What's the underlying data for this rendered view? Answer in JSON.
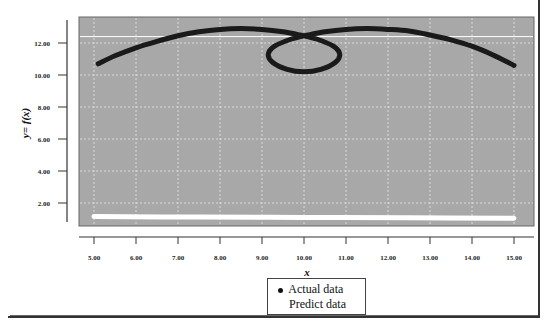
{
  "chart_data": {
    "type": "line",
    "title": "",
    "xlabel": "x",
    "ylabel": "y= f(x)",
    "xlim": [
      4.6,
      15.5
    ],
    "ylim": [
      0.3,
      13.5
    ],
    "x_ticks": [
      "5.00",
      "6.00",
      "7.00",
      "8.00",
      "9.00",
      "10.00",
      "11.00",
      "12.00",
      "13.00",
      "14.00",
      "15.00"
    ],
    "y_ticks": [
      "2.00",
      "4.00",
      "6.00",
      "8.00",
      "10.00",
      "12.00"
    ],
    "grid": true,
    "plot_background": "#a8a8a8",
    "legend_position": "bottom-center",
    "series": [
      {
        "name": "Actual data",
        "color": "#1a1a1a",
        "marker": "circle",
        "points": [
          [
            5.1,
            10.7
          ],
          [
            5.5,
            11.2
          ],
          [
            6.0,
            11.7
          ],
          [
            6.5,
            12.1
          ],
          [
            7.0,
            12.45
          ],
          [
            7.5,
            12.7
          ],
          [
            8.0,
            12.85
          ],
          [
            8.5,
            12.9
          ],
          [
            9.0,
            12.85
          ],
          [
            9.5,
            12.7
          ],
          [
            9.9,
            12.5
          ],
          [
            10.3,
            12.25
          ],
          [
            10.7,
            11.8
          ],
          [
            10.85,
            11.3
          ],
          [
            10.75,
            10.8
          ],
          [
            10.4,
            10.35
          ],
          [
            10.0,
            10.2
          ],
          [
            9.6,
            10.35
          ],
          [
            9.25,
            10.8
          ],
          [
            9.15,
            11.3
          ],
          [
            9.3,
            11.8
          ],
          [
            9.7,
            12.25
          ],
          [
            10.1,
            12.5
          ],
          [
            10.5,
            12.7
          ],
          [
            11.0,
            12.85
          ],
          [
            11.5,
            12.9
          ],
          [
            12.0,
            12.85
          ],
          [
            12.5,
            12.75
          ],
          [
            13.0,
            12.5
          ],
          [
            13.5,
            12.2
          ],
          [
            14.0,
            11.8
          ],
          [
            14.5,
            11.25
          ],
          [
            15.0,
            10.6
          ]
        ]
      },
      {
        "name": "Predict data",
        "color": "#ffffff",
        "marker": "none",
        "points": [
          [
            5.0,
            1.15
          ],
          [
            7.5,
            1.12
          ],
          [
            10.0,
            1.1
          ],
          [
            12.5,
            1.08
          ],
          [
            15.0,
            1.05
          ]
        ]
      }
    ],
    "reference_lines": [
      {
        "orientation": "horizontal",
        "y": 12.4,
        "color": "#ffffff"
      }
    ]
  },
  "axes": {
    "x_title": "x",
    "y_title": "y= f(x)"
  },
  "legend": {
    "items": [
      {
        "label": "Actual data",
        "marker": "dot"
      },
      {
        "label": "Predict data",
        "marker": "none"
      }
    ]
  }
}
